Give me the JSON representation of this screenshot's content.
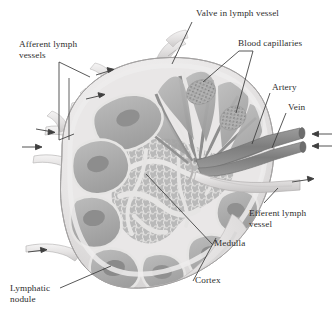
{
  "figure": {
    "background_color": "#ffffff",
    "text_color": "#2e2e2e",
    "leader_color": "#3a3a3a"
  },
  "palette": {
    "capsule_light": "#eceaea",
    "capsule_shadow": "#d8d6d6",
    "cortex_mid": "#c3c3c3",
    "cortex_dark": "#a2a2a2",
    "nodule_dark": "#8f8f8f",
    "medulla_mid": "#b6b6b6",
    "sinus_light": "#e6e5e4",
    "vessel_dark": "#8a8a8a",
    "vessel_mid": "#a8a8a8",
    "afferent_pale": "#e3e1e0",
    "outline": "#7e7e7e"
  },
  "labels": [
    {
      "id": "valve-in-lymph-vessel",
      "text": "Valve in lymph vessel",
      "x": 196,
      "y": 11,
      "align": "left",
      "lines": 1
    },
    {
      "id": "blood-capillaries",
      "text": "Blood capillaries",
      "x": 240,
      "y": 41,
      "align": "left",
      "lines": 1
    },
    {
      "id": "afferent-lymph-vessels",
      "text": "Afferent lymph\nvessels",
      "x": 19,
      "y": 40,
      "align": "left",
      "lines": 2
    },
    {
      "id": "artery",
      "text": "Artery",
      "x": 272,
      "y": 84,
      "align": "left",
      "lines": 1
    },
    {
      "id": "vein",
      "text": "Vein",
      "x": 288,
      "y": 104,
      "align": "left",
      "lines": 1
    },
    {
      "id": "efferent-lymph-vessel",
      "text": "Efferent lymph\nvessel",
      "x": 250,
      "y": 210,
      "align": "left",
      "lines": 2
    },
    {
      "id": "medulla",
      "text": "Medulla",
      "x": 215,
      "y": 240,
      "align": "left",
      "lines": 1
    },
    {
      "id": "cortex",
      "text": "Cortex",
      "x": 196,
      "y": 277,
      "align": "left",
      "lines": 1
    },
    {
      "id": "lymphatic-nodule",
      "text": "Lymphatic\nnodule",
      "x": 10,
      "y": 285,
      "align": "left",
      "lines": 2
    }
  ],
  "structures": [
    {
      "id": "capsule",
      "name": "Capsule"
    },
    {
      "id": "cortex-region",
      "name": "Cortex"
    },
    {
      "id": "medulla-region",
      "name": "Medulla"
    },
    {
      "id": "lymphatic-nodules",
      "name": "Lymphatic nodules",
      "count": 7
    },
    {
      "id": "afferent-vessels",
      "name": "Afferent lymph vessels",
      "count": 5
    },
    {
      "id": "efferent-vessel",
      "name": "Efferent lymph vessel",
      "count": 1
    },
    {
      "id": "artery-vessel",
      "name": "Artery",
      "count": 1
    },
    {
      "id": "vein-vessel",
      "name": "Vein",
      "count": 1
    },
    {
      "id": "capillary-beds",
      "name": "Blood capillaries",
      "count": 2
    },
    {
      "id": "valve",
      "name": "Valve in lymph vessel",
      "count": 1
    },
    {
      "id": "trabeculae",
      "name": "Trabeculae / medullary sinuses"
    }
  ],
  "flow_arrows": [
    {
      "id": "afferent-arrow-1",
      "direction": "inward"
    },
    {
      "id": "afferent-arrow-2",
      "direction": "inward"
    },
    {
      "id": "afferent-arrow-3",
      "direction": "inward"
    },
    {
      "id": "afferent-arrow-4",
      "direction": "inward"
    },
    {
      "id": "afferent-arrow-5",
      "direction": "inward"
    },
    {
      "id": "artery-arrow",
      "direction": "inward"
    },
    {
      "id": "vein-arrow",
      "direction": "inward"
    },
    {
      "id": "efferent-arrow",
      "direction": "outward"
    }
  ]
}
